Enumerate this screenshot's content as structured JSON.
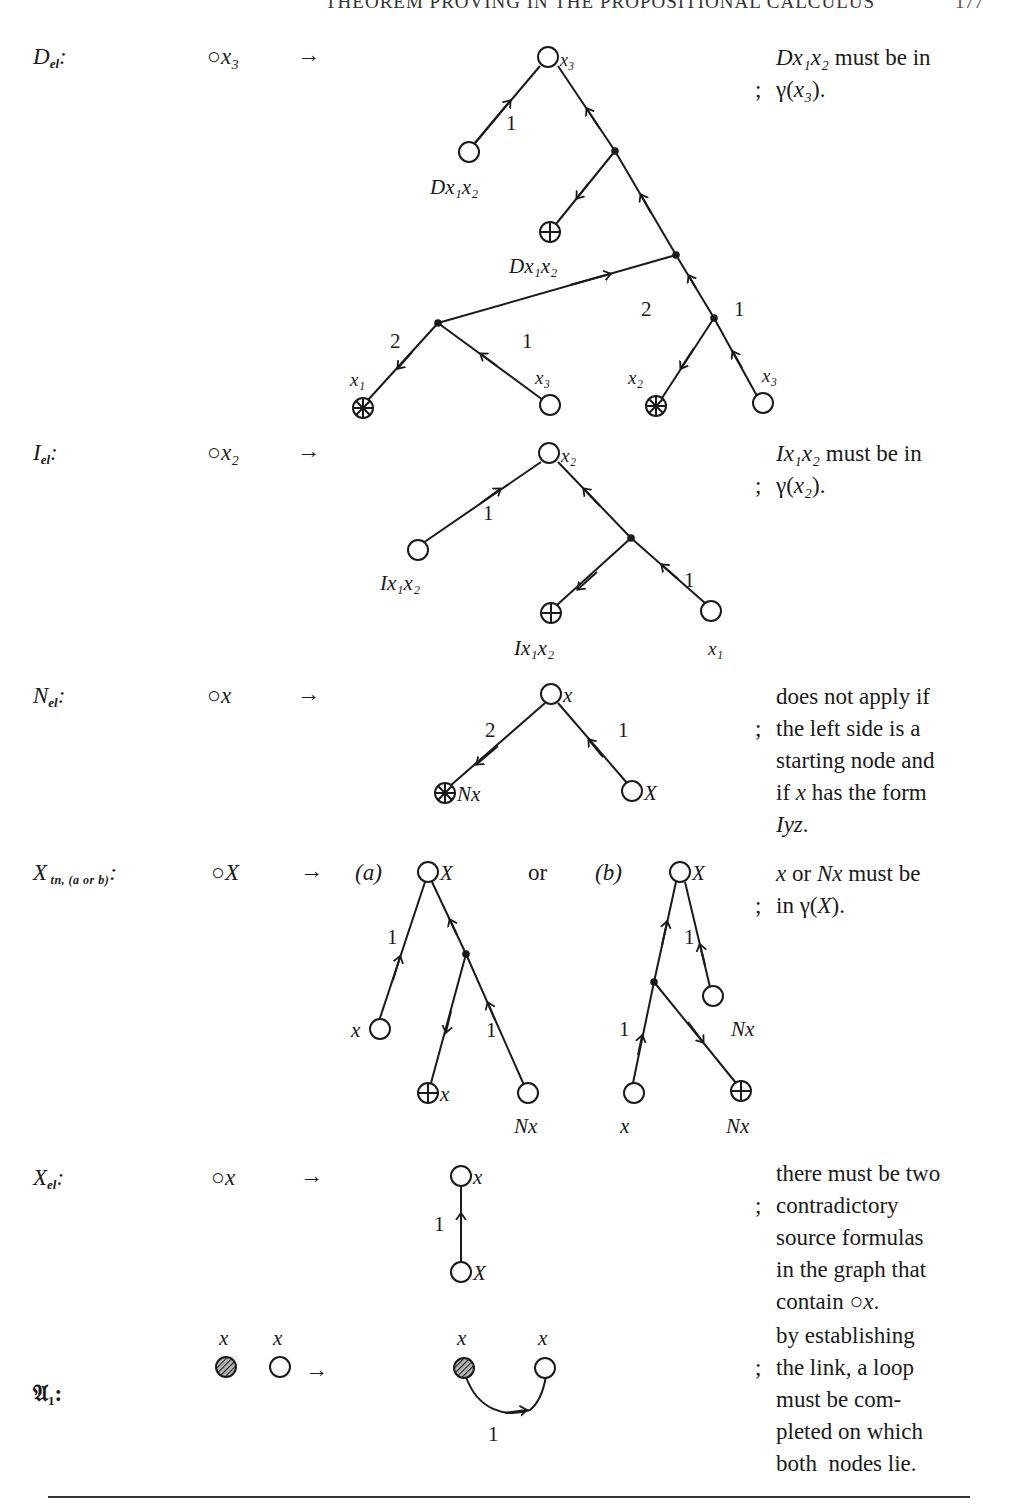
{
  "header": {
    "running_title": "THEOREM PROVING IN THE PROPOSITIONAL CALCULUS",
    "page_number": "177"
  },
  "rules": [
    {
      "id": "D_el",
      "name": "D",
      "subscript": "el",
      "lhs": "x₃",
      "arrow": "→",
      "condition_lines": [
        "Dx₁x₂ must be in",
        "γ(x₃)."
      ],
      "graph": {
        "root": "x₃",
        "nodes": [
          {
            "label": "Dx₁x₂",
            "type": "open"
          },
          {
            "label": "Dx₁x₂",
            "type": "plus"
          },
          {
            "label": "x₁",
            "type": "cross"
          },
          {
            "label": "x₃",
            "type": "open"
          },
          {
            "label": "x₂",
            "type": "cross"
          },
          {
            "label": "x₃",
            "type": "open"
          }
        ],
        "edge_labels": [
          "1",
          "2",
          "1",
          "2",
          "1"
        ]
      }
    },
    {
      "id": "I_el",
      "name": "I",
      "subscript": "el",
      "lhs": "x₂",
      "arrow": "→",
      "condition_lines": [
        "Ix₁x₂ must be in",
        "γ(x₂)."
      ],
      "graph": {
        "root": "x₂",
        "nodes": [
          {
            "label": "Ix₁x₂",
            "type": "open"
          },
          {
            "label": "Ix₁x₂",
            "type": "plus"
          },
          {
            "label": "x₁",
            "type": "open"
          }
        ],
        "edge_labels": [
          "1",
          "1"
        ]
      }
    },
    {
      "id": "N_el",
      "name": "N",
      "subscript": "el",
      "lhs": "x",
      "arrow": "→",
      "condition_lines": [
        "does not apply if",
        "the left side is a",
        "starting node and",
        "if x has the form",
        "Iyz."
      ],
      "graph": {
        "root": "x",
        "nodes": [
          {
            "label": "Nx",
            "type": "cross"
          },
          {
            "label": "X",
            "type": "open"
          }
        ],
        "edge_labels": [
          "2",
          "1"
        ]
      }
    },
    {
      "id": "X_tn",
      "name": "X",
      "subscript": "tn, (a or b)",
      "lhs": "X",
      "arrow": "→",
      "variant_a": "(a)",
      "or_label": "or",
      "variant_b": "(b)",
      "condition_lines": [
        "x or Nx must be",
        "in γ(X)."
      ],
      "graph_a": {
        "root": "X",
        "nodes": [
          {
            "label": "x",
            "type": "open"
          },
          {
            "label": "x",
            "type": "plus"
          },
          {
            "label": "Nx",
            "type": "open"
          }
        ],
        "edge_labels": [
          "1",
          "1"
        ]
      },
      "graph_b": {
        "root": "X",
        "nodes": [
          {
            "label": "Nx",
            "type": "open"
          },
          {
            "label": "x",
            "type": "open"
          },
          {
            "label": "Nx",
            "type": "plus"
          }
        ],
        "edge_labels": [
          "1",
          "1"
        ]
      }
    },
    {
      "id": "X_el",
      "name": "X",
      "subscript": "el",
      "lhs": "x",
      "arrow": "→",
      "condition_lines": [
        "there must be two",
        "contradictory",
        "source formulas",
        "in the graph that",
        "contain ○x."
      ],
      "graph": {
        "root": "x",
        "nodes": [
          {
            "label": "X",
            "type": "open"
          }
        ],
        "edge_labels": [
          "1"
        ]
      }
    },
    {
      "id": "A_1",
      "name": "𝔄",
      "subscript": "1",
      "lhs_labels": [
        "x",
        "x"
      ],
      "arrow": "→",
      "condition_lines": [
        "by establishing",
        "the link, a loop",
        "must be com-",
        "pleted on which",
        "both  nodes lie."
      ],
      "graph": {
        "nodes": [
          {
            "label": "x",
            "type": "hatched"
          },
          {
            "label": "x",
            "type": "open"
          }
        ],
        "edge_labels": [
          "1"
        ]
      }
    }
  ],
  "separator": ";"
}
